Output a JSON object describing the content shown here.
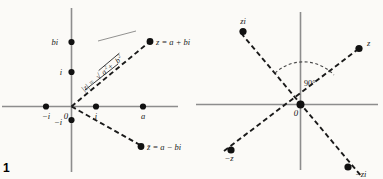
{
  "figure": {
    "number": "1",
    "background_color": "#fbfaf7",
    "axis_color": "#8d8d8d",
    "ray_color": "#1a1a1a",
    "dot_color": "#111111",
    "width": 383,
    "height": 179
  },
  "left_diagram": {
    "name": "complex-number-and-conjugate",
    "origin_label": "0",
    "imaginary_axis": {
      "labels": [
        {
          "text": "bi",
          "value": "bi"
        },
        {
          "text": "i",
          "value": "i"
        },
        {
          "text": "−i",
          "value": "-i"
        }
      ]
    },
    "real_axis": {
      "labels": [
        {
          "text": "−i",
          "value": "-i"
        },
        {
          "text": "i",
          "value": "i"
        },
        {
          "text": "a",
          "value": "a"
        }
      ]
    },
    "points": [
      {
        "label": "z = a + bi",
        "name": "point-z"
      },
      {
        "label": "z̄ = a − bi",
        "name": "point-z-conjugate"
      }
    ],
    "modulus_label": {
      "prefix": "|z| = ",
      "radical": "√",
      "radicand_a": "a",
      "exponent_a": "2",
      "plus": " + ",
      "radicand_b": "b",
      "exponent_b": "2",
      "full_text": "|z| = √(a² + b²)"
    }
  },
  "right_diagram": {
    "name": "multiplication-by-i-rotation",
    "origin_label": "0",
    "angle_label": "90°",
    "points": [
      {
        "label": "zi",
        "name": "point-zi"
      },
      {
        "label": "z",
        "name": "point-z"
      },
      {
        "label": "−z",
        "name": "point-negative-z"
      },
      {
        "label": "−zi",
        "name": "point-negative-zi"
      }
    ]
  }
}
